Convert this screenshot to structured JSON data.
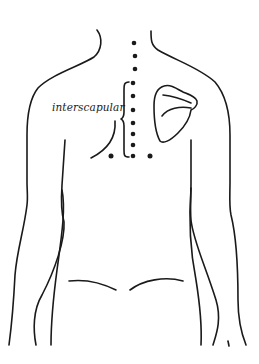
{
  "diagram": {
    "label": "interscapular",
    "colors": {
      "ink": "#1a1a1a",
      "background": "#ffffff"
    },
    "points": {
      "spine_x": 134,
      "spine_y": [
        43,
        56,
        69,
        82,
        96,
        110,
        123,
        134,
        145,
        156
      ],
      "lateral": [
        {
          "x": 111,
          "y": 156
        },
        {
          "x": 150,
          "y": 156
        }
      ]
    }
  }
}
